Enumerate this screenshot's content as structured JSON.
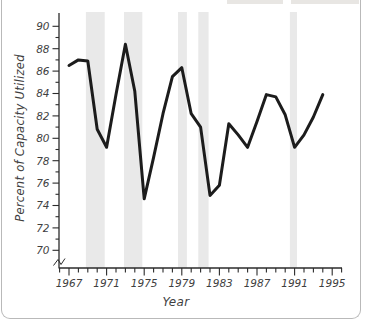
{
  "chart_data": {
    "type": "line",
    "title": "",
    "xlabel": "Year",
    "ylabel": "Percent of Capacity Utilized",
    "x": [
      1967,
      1968,
      1969,
      1970,
      1971,
      1972,
      1973,
      1974,
      1975,
      1976,
      1977,
      1978,
      1979,
      1980,
      1981,
      1982,
      1983,
      1984,
      1985,
      1986,
      1987,
      1988,
      1989,
      1990,
      1991,
      1992,
      1993,
      1994
    ],
    "series": [
      {
        "name": "percent-of-capacity-utilized",
        "values": [
          86.5,
          87.0,
          86.9,
          80.8,
          79.2,
          83.9,
          88.4,
          84.2,
          74.6,
          78.3,
          82.2,
          85.5,
          86.3,
          82.2,
          81.0,
          74.9,
          75.8,
          81.3,
          80.3,
          79.2,
          81.5,
          83.9,
          83.7,
          82.1,
          79.2,
          80.3,
          81.9,
          83.9
        ]
      }
    ],
    "ylim": [
      70,
      90
    ],
    "y_axis_break": true,
    "y_major_ticks": [
      90,
      88,
      86,
      84,
      82,
      80,
      78,
      76,
      74,
      72,
      70
    ],
    "y_minor_tick_step": 1,
    "x_major_tick_labels": [
      1967,
      1971,
      1975,
      1979,
      1983,
      1987,
      1991,
      1995
    ],
    "x_minor_tick_step": 1,
    "x_drawn_range": [
      1966,
      1996
    ],
    "grid": "off",
    "legend": "none",
    "recession_bands_years": [
      [
        1968.8,
        1970.8
      ],
      [
        1972.85,
        1974.8
      ],
      [
        1978.6,
        1979.55
      ],
      [
        1980.75,
        1981.85
      ],
      [
        1990.5,
        1991.25
      ]
    ],
    "colors": {
      "line": "#1c1c1c",
      "band": "#e9e9e9",
      "axis": "#2b2b2b",
      "text": "#3f3f3f"
    }
  }
}
